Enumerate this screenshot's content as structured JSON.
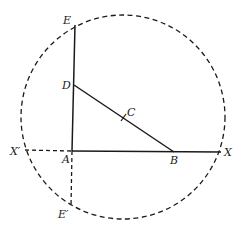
{
  "diagram": {
    "labels": {
      "E": "E",
      "D": "D",
      "C": "C",
      "A": "A",
      "B": "B",
      "X": "X",
      "X_prime": "X′",
      "E_prime": "E′"
    },
    "colors": {
      "stroke": "#1a1a1a",
      "background": "#ffffff"
    },
    "elements": {
      "circle": {
        "style": "dashed",
        "center": "C"
      },
      "solid_lines": [
        "A-E",
        "A-X",
        "D-B"
      ],
      "dashed_lines": [
        "X'-A",
        "A-E'"
      ],
      "tick_mark": "C (midpoint of DB)"
    }
  }
}
